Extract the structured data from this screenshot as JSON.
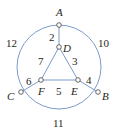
{
  "diagram": {
    "type": "weighted-graph",
    "colors": {
      "edge": "#7a9cc9",
      "node_fill": "#ffffff",
      "node_stroke": "#555555",
      "text": "#231f20"
    },
    "circle": {
      "cx": 59,
      "cy": 67,
      "r": 42
    },
    "nodes": [
      {
        "id": "A",
        "label": "A",
        "x": 59,
        "y": 25,
        "lx": 56,
        "ly": 16
      },
      {
        "id": "B",
        "label": "B",
        "x": 98,
        "y": 92,
        "lx": 102,
        "ly": 100
      },
      {
        "id": "C",
        "label": "C",
        "x": 21,
        "y": 92,
        "lx": 7,
        "ly": 100
      },
      {
        "id": "D",
        "label": "D",
        "x": 59,
        "y": 47,
        "lx": 63,
        "ly": 52
      },
      {
        "id": "E",
        "label": "E",
        "x": 78,
        "y": 80,
        "lx": 71,
        "ly": 95
      },
      {
        "id": "F",
        "label": "F",
        "x": 41,
        "y": 80,
        "lx": 38,
        "ly": 95
      }
    ],
    "edges": [
      {
        "from": "A",
        "to": "D",
        "weight": "2",
        "lx": 49,
        "ly": 41,
        "kind": "line"
      },
      {
        "from": "D",
        "to": "E",
        "weight": "3",
        "lx": 72,
        "ly": 65,
        "kind": "line"
      },
      {
        "from": "E",
        "to": "B",
        "weight": "4",
        "lx": 86,
        "ly": 84,
        "kind": "line"
      },
      {
        "from": "F",
        "to": "E",
        "weight": "5",
        "lx": 56,
        "ly": 95,
        "kind": "line"
      },
      {
        "from": "C",
        "to": "F",
        "weight": "6",
        "lx": 26,
        "ly": 85,
        "kind": "line"
      },
      {
        "from": "D",
        "to": "F",
        "weight": "7",
        "lx": 38,
        "ly": 65,
        "kind": "line"
      },
      {
        "from": "A",
        "to": "B",
        "weight": "10",
        "lx": 98,
        "ly": 47,
        "kind": "arc"
      },
      {
        "from": "B",
        "to": "C",
        "weight": "11",
        "lx": 53,
        "ly": 127,
        "kind": "arc"
      },
      {
        "from": "C",
        "to": "A",
        "weight": "12",
        "lx": 6,
        "ly": 47,
        "kind": "arc"
      }
    ]
  }
}
